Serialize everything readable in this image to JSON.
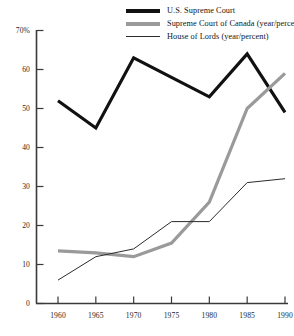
{
  "chart_data": {
    "type": "line",
    "title": "",
    "xlabel": "",
    "ylabel": "",
    "x": [
      1960,
      1965,
      1970,
      1975,
      1980,
      1985,
      1990
    ],
    "xlim": [
      1958,
      1991
    ],
    "ylim": [
      0,
      70
    ],
    "grid": false,
    "legend_position": "top-right",
    "x_tick_labels": [
      "1960",
      "1965",
      "1970",
      "1975",
      "1980",
      "1985",
      "1990"
    ],
    "y_tick_labels": [
      "0",
      "10",
      "20",
      "30",
      "40",
      "50",
      "60",
      "70%"
    ],
    "y_ticks": [
      0,
      10,
      20,
      30,
      40,
      50,
      60,
      70
    ],
    "series": [
      {
        "name": "U.S. Supreme Court",
        "color": "#111111",
        "width": 3.2,
        "values": [
          52,
          45,
          63,
          58,
          53,
          64,
          49
        ]
      },
      {
        "name": "Supreme Court of Canada (year/percent)",
        "color": "#9a9a9a",
        "width": 3.2,
        "values": [
          13.5,
          13,
          12,
          15.5,
          26,
          50,
          59
        ]
      },
      {
        "name": "House of Lords (year/percent)",
        "color": "#2b2b2b",
        "width": 1,
        "values": [
          6,
          12,
          14,
          21,
          21,
          31,
          32
        ]
      }
    ]
  },
  "legend": {
    "items": [
      {
        "label": "U.S. Supreme Court",
        "swatch": "thick-black-line-icon"
      },
      {
        "label": "Supreme Court of Canada (year/percent)",
        "swatch": "thick-gray-line-icon"
      },
      {
        "label": "House of Lords (year/percent)",
        "swatch": "thin-black-line-icon"
      }
    ]
  },
  "axes": {
    "y_labels": [
      "70%",
      "60",
      "50",
      "40",
      "30",
      "20",
      "10",
      "0"
    ],
    "x_labels": [
      "1960",
      "1965",
      "1970",
      "1975",
      "1980",
      "1985",
      "1990"
    ]
  }
}
